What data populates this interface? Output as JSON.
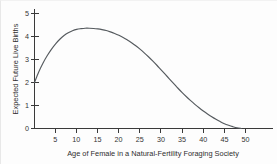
{
  "chart_data": {
    "type": "line",
    "title": "",
    "subtitle": "",
    "xlabel": "Age of Female in a Natural-Fertility Foraging Society",
    "ylabel": "Expected Future Live Births",
    "xlim": [
      0,
      55
    ],
    "ylim": [
      0,
      5
    ],
    "xticks": [
      5,
      10,
      15,
      20,
      25,
      30,
      35,
      40,
      45,
      50
    ],
    "xtick_labels": [
      "5",
      "10",
      "15",
      "20",
      "25",
      "30",
      "35",
      "40",
      "45",
      "50"
    ],
    "yticks": [
      0,
      1,
      2,
      3,
      4,
      5
    ],
    "ytick_labels": [
      "0",
      "1",
      "2",
      "3",
      "4",
      "5"
    ],
    "grid": false,
    "legend": false,
    "legend_position": "none",
    "series": [
      {
        "name": "Expected future live births by age",
        "color": "#555a5e",
        "x": [
          0,
          1,
          2,
          3,
          4,
          5,
          6,
          7,
          8,
          9,
          10,
          11,
          12,
          13,
          14,
          15,
          16,
          17,
          18,
          19,
          20,
          21,
          22,
          23,
          24,
          25,
          26,
          27,
          28,
          29,
          30,
          31,
          32,
          33,
          34,
          35,
          36,
          37,
          38,
          39,
          40,
          41,
          42,
          43,
          44,
          45,
          46,
          47,
          48,
          49
        ],
        "y": [
          2.0,
          2.46,
          2.84,
          3.16,
          3.44,
          3.68,
          3.88,
          4.04,
          4.16,
          4.25,
          4.31,
          4.34,
          4.36,
          4.36,
          4.35,
          4.33,
          4.3,
          4.26,
          4.2,
          4.13,
          4.05,
          3.96,
          3.85,
          3.73,
          3.6,
          3.45,
          3.29,
          3.12,
          2.94,
          2.75,
          2.55,
          2.35,
          2.15,
          1.95,
          1.75,
          1.56,
          1.38,
          1.21,
          1.05,
          0.9,
          0.76,
          0.63,
          0.51,
          0.4,
          0.3,
          0.21,
          0.14,
          0.08,
          0.03,
          0.0
        ]
      }
    ],
    "annotations": []
  },
  "axes": {
    "x_title": "Age of Female in a Natural-Fertility Foraging Society",
    "y_title": "Expected Future Live Births",
    "x_tick_labels": [
      "5",
      "10",
      "15",
      "20",
      "25",
      "30",
      "35",
      "40",
      "45",
      "50"
    ],
    "y_tick_labels": [
      "0",
      "1",
      "2",
      "3",
      "4",
      "5"
    ]
  },
  "colors": {
    "curve": "#555a5e",
    "axis": "#3a3a3a",
    "text": "#333333",
    "background": "#fdfdfd"
  }
}
